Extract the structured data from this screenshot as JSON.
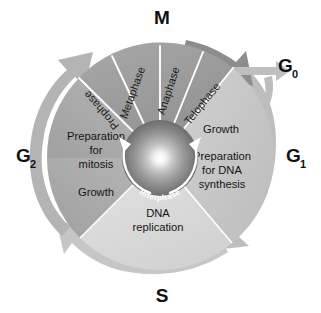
{
  "diagram": {
    "center": {
      "label": "Interphase",
      "icon": "interphase-sphere"
    },
    "outer_labels": [
      {
        "id": "m",
        "base": "M",
        "sub": "",
        "position": "top"
      },
      {
        "id": "g0",
        "base": "G",
        "sub": "0",
        "position": "upper-right"
      },
      {
        "id": "g1",
        "base": "G",
        "sub": "1",
        "position": "right"
      },
      {
        "id": "s",
        "base": "S",
        "sub": "",
        "position": "bottom"
      },
      {
        "id": "g2",
        "base": "G",
        "sub": "2",
        "position": "left"
      }
    ],
    "phases": [
      {
        "id": "m-phase",
        "name": "M",
        "color": "#9a9a9a",
        "subphases": [
          "Prophase",
          "Metaphase",
          "Anaphase",
          "Telophase"
        ]
      },
      {
        "id": "g1-phase",
        "name": "G1",
        "color": "#c9c9c9",
        "lines": [
          "Growth",
          "Preparation",
          "for DNA",
          "synthesis"
        ]
      },
      {
        "id": "s-phase",
        "name": "S",
        "color": "#dcdcdc",
        "lines": [
          "DNA",
          "replication"
        ]
      },
      {
        "id": "g2-phase",
        "name": "G2",
        "color": "#aeaeae",
        "lines": [
          "Preparation",
          "for",
          "mitosis",
          "Growth"
        ]
      }
    ],
    "arrows": [
      {
        "id": "arrow-g2-to-m",
        "name": "g2-to-m-arrow",
        "color": "#b4b4b4"
      },
      {
        "id": "arrow-m-to-g1",
        "name": "m-to-g1-arrow",
        "color": "#8f8f8f"
      },
      {
        "id": "arrow-g1-to-s",
        "name": "g1-to-s-arrow",
        "color": "#b9b9b9"
      },
      {
        "id": "arrow-s-to-g2",
        "name": "s-to-g2-arrow",
        "color": "#c4c4c4"
      },
      {
        "id": "arrow-exit-g0",
        "name": "exit-to-g0-arrow",
        "color": "#bfbfbf"
      },
      {
        "id": "arrow-return-g0",
        "name": "g0-return-arrow",
        "color": "#bcbcbc"
      }
    ],
    "colors": {
      "background": "#ffffff",
      "m_wedge": "#9a9a9a",
      "g1_wedge": "#c9c9c9",
      "s_wedge": "#dcdcdc",
      "g2_wedge": "#aeaeae",
      "ring_outer": "#b6b6b6",
      "text_dark": "#151515",
      "text_light": "#ffffff"
    }
  }
}
